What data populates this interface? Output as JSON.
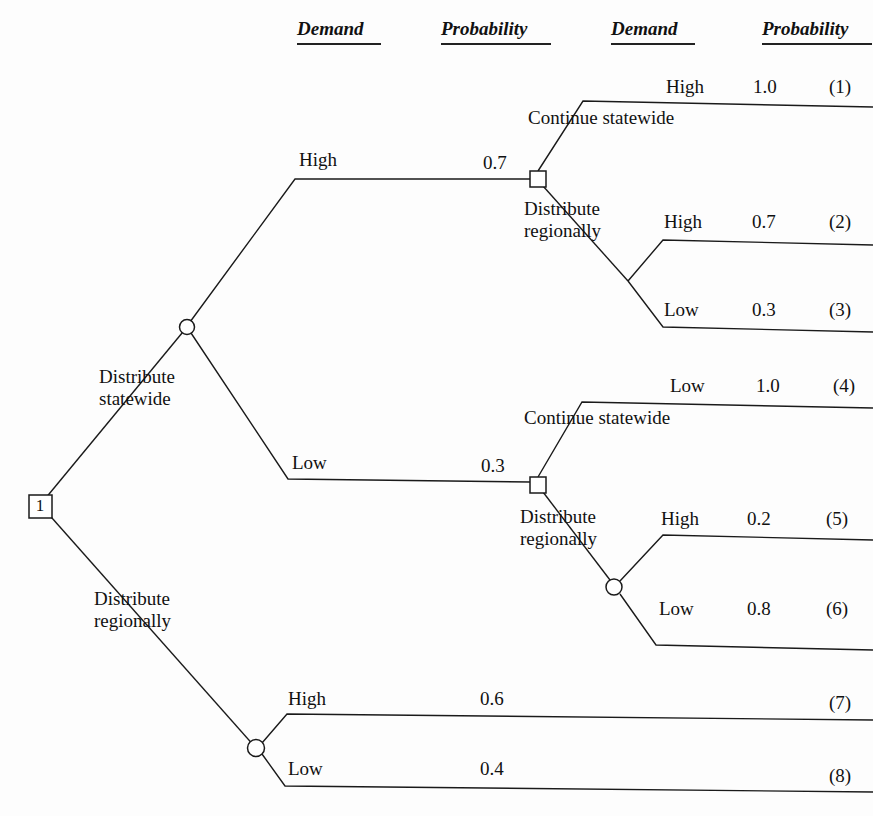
{
  "figure": {
    "type": "decision-tree",
    "background": "#fdfdfd",
    "stroke_color": "#1a1a1a"
  },
  "columns": [
    {
      "id": "demand-1",
      "label": "Demand",
      "x": 297,
      "y": 18,
      "width": 84
    },
    {
      "id": "probability-1",
      "label": "Probability",
      "x": 441,
      "y": 18,
      "width": 110
    },
    {
      "id": "demand-2",
      "label": "Demand",
      "x": 611,
      "y": 18,
      "width": 84
    },
    {
      "id": "probability-2",
      "label": "Probability",
      "x": 762,
      "y": 18,
      "width": 110
    }
  ],
  "root": {
    "id": "1",
    "label": "1",
    "x": 29,
    "y": 495,
    "size": 23
  },
  "decision_labels": [
    {
      "id": "root-upper",
      "text": "Distribute\nstatewide",
      "x": 99,
      "y": 366
    },
    {
      "id": "root-lower",
      "text": "Distribute\nregionally",
      "x": 94,
      "y": 588
    },
    {
      "id": "high-continue",
      "text": "Continue statewide",
      "x": 528,
      "y": 107
    },
    {
      "id": "high-distribute",
      "text": "Distribute\nregionally",
      "x": 524,
      "y": 198
    },
    {
      "id": "low-continue",
      "text": "Continue statewide",
      "x": 524,
      "y": 407
    },
    {
      "id": "low-distribute",
      "text": "Distribute\nregionally",
      "x": 520,
      "y": 506
    }
  ],
  "stage1_branches": [
    {
      "id": "stage1-high",
      "demand": "High",
      "demand_x": 299,
      "demand_y": 149,
      "probability": "0.7",
      "prob_x": 483,
      "prob_y": 152
    },
    {
      "id": "stage1-low",
      "demand": "Low",
      "demand_x": 292,
      "demand_y": 452,
      "probability": "0.3",
      "prob_x": 481,
      "prob_y": 455
    }
  ],
  "outcomes": [
    {
      "id": "1",
      "demand": "High",
      "probability": "1.0",
      "tag": "(1)",
      "demand_x": 666,
      "demand_y": 76,
      "prob_x": 753,
      "prob_y": 76,
      "tag_x": 829,
      "tag_y": 76
    },
    {
      "id": "2",
      "demand": "High",
      "probability": "0.7",
      "tag": "(2)",
      "demand_x": 664,
      "demand_y": 211,
      "prob_x": 752,
      "prob_y": 211,
      "tag_x": 829,
      "tag_y": 211
    },
    {
      "id": "3",
      "demand": "Low",
      "probability": "0.3",
      "tag": "(3)",
      "demand_x": 664,
      "demand_y": 299,
      "prob_x": 752,
      "prob_y": 299,
      "tag_x": 829,
      "tag_y": 299
    },
    {
      "id": "4",
      "demand": "Low",
      "probability": "1.0",
      "tag": "(4)",
      "demand_x": 670,
      "demand_y": 375,
      "prob_x": 756,
      "prob_y": 375,
      "tag_x": 833,
      "tag_y": 375
    },
    {
      "id": "5",
      "demand": "High",
      "probability": "0.2",
      "tag": "(5)",
      "demand_x": 661,
      "demand_y": 508,
      "prob_x": 747,
      "prob_y": 508,
      "tag_x": 826,
      "tag_y": 508
    },
    {
      "id": "6",
      "demand": "Low",
      "probability": "0.8",
      "tag": "(6)",
      "demand_x": 659,
      "demand_y": 598,
      "prob_x": 747,
      "prob_y": 598,
      "tag_x": 826,
      "tag_y": 598
    },
    {
      "id": "7",
      "demand": "High",
      "probability": "0.6",
      "tag": "(7)",
      "demand_x": 288,
      "demand_y": 688,
      "prob_x": 480,
      "prob_y": 688,
      "tag_x": 829,
      "tag_y": 692
    },
    {
      "id": "8",
      "demand": "Low",
      "probability": "0.4",
      "tag": "(8)",
      "demand_x": 288,
      "demand_y": 758,
      "prob_x": 480,
      "prob_y": 758,
      "tag_x": 829,
      "tag_y": 765
    }
  ],
  "chance_nodes": [
    {
      "id": "chance-statewide",
      "cx": 187,
      "cy": 327,
      "r": 7.5
    },
    {
      "id": "chance-low-regional",
      "cx": 614,
      "cy": 587,
      "r": 8
    },
    {
      "id": "chance-root-regional",
      "cx": 256,
      "cy": 748,
      "r": 8.5
    }
  ],
  "decision_nodes": [
    {
      "id": "decision-high",
      "x": 530,
      "y": 171,
      "size": 16
    },
    {
      "id": "decision-low",
      "x": 530,
      "y": 477,
      "size": 16
    }
  ],
  "edges": [
    {
      "id": "root-to-statewide",
      "points": "40,505 187,327"
    },
    {
      "id": "root-to-regional",
      "points": "44,509 256,748"
    },
    {
      "id": "statewide-high",
      "points": "190,322 295,179 530,179"
    },
    {
      "id": "statewide-low",
      "points": "191,333 288,479 530,482"
    },
    {
      "id": "d1-continue",
      "points": "538,171 583,101 873,107"
    },
    {
      "id": "d1-regional",
      "points": "543,186 628,281"
    },
    {
      "id": "d1-regional-high",
      "points": "628,281 663,240 873,245"
    },
    {
      "id": "d1-regional-low",
      "points": "628,281 663,327 873,332"
    },
    {
      "id": "d2-continue",
      "points": "538,477 582,402 873,408"
    },
    {
      "id": "d2-regional",
      "points": "543,492 610,580"
    },
    {
      "id": "d2-regional-high",
      "points": "620,581 663,535 873,540"
    },
    {
      "id": "d2-regional-low",
      "points": "620,594 656,645 873,650"
    },
    {
      "id": "root-regional-high",
      "points": "262,743 287,714 873,720"
    },
    {
      "id": "root-regional-low",
      "points": "262,754 285,786 873,792"
    }
  ],
  "chart_data": {
    "type": "diagram",
    "nodes": [
      {
        "id": "1",
        "kind": "decision",
        "label": "1"
      },
      {
        "id": "A",
        "kind": "chance",
        "label": "Distribute statewide outcome"
      },
      {
        "id": "B",
        "kind": "decision",
        "label": "High demand decision"
      },
      {
        "id": "C",
        "kind": "decision",
        "label": "Low demand decision"
      },
      {
        "id": "D",
        "kind": "chance",
        "label": "Low demand regional outcome"
      },
      {
        "id": "E",
        "kind": "chance",
        "label": "Distribute regionally outcome"
      }
    ],
    "paths": [
      {
        "outcome": "(1)",
        "sequence": [
          "Distribute statewide",
          "High 0.7",
          "Continue statewide",
          "High 1.0"
        ]
      },
      {
        "outcome": "(2)",
        "sequence": [
          "Distribute statewide",
          "High 0.7",
          "Distribute regionally",
          "High 0.7"
        ]
      },
      {
        "outcome": "(3)",
        "sequence": [
          "Distribute statewide",
          "High 0.7",
          "Distribute regionally",
          "Low 0.3"
        ]
      },
      {
        "outcome": "(4)",
        "sequence": [
          "Distribute statewide",
          "Low 0.3",
          "Continue statewide",
          "Low 1.0"
        ]
      },
      {
        "outcome": "(5)",
        "sequence": [
          "Distribute statewide",
          "Low 0.3",
          "Distribute regionally",
          "High 0.2"
        ]
      },
      {
        "outcome": "(6)",
        "sequence": [
          "Distribute statewide",
          "Low 0.3",
          "Distribute regionally",
          "Low 0.8"
        ]
      },
      {
        "outcome": "(7)",
        "sequence": [
          "Distribute regionally",
          "High 0.6"
        ]
      },
      {
        "outcome": "(8)",
        "sequence": [
          "Distribute regionally",
          "Low 0.4"
        ]
      }
    ]
  }
}
